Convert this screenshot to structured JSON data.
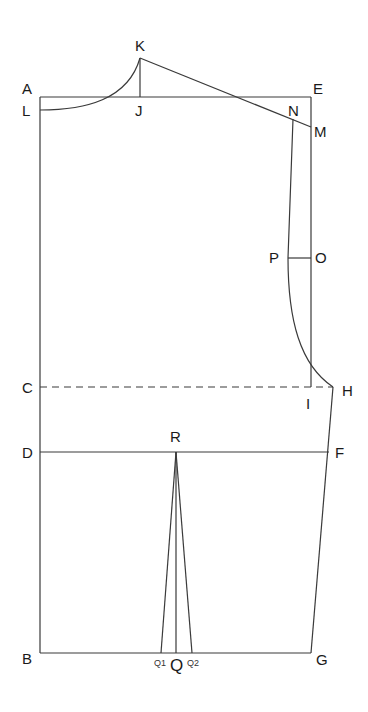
{
  "diagram": {
    "type": "bodice-pattern-draft",
    "line_color": "#3a3a3a",
    "label_color": "#1a1a1a",
    "points": {
      "A": {
        "label": "A",
        "x": 40,
        "y": 97
      },
      "B": {
        "label": "B",
        "x": 40,
        "y": 653
      },
      "C": {
        "label": "C",
        "x": 40,
        "y": 387
      },
      "D": {
        "label": "D",
        "x": 40,
        "y": 452
      },
      "E": {
        "label": "E",
        "x": 311,
        "y": 97
      },
      "F": {
        "label": "F",
        "x": 329,
        "y": 452
      },
      "G": {
        "label": "G",
        "x": 311,
        "y": 653
      },
      "H": {
        "label": "H",
        "x": 333,
        "y": 387
      },
      "I": {
        "label": "I",
        "x": 311,
        "y": 387
      },
      "J": {
        "label": "J",
        "x": 140,
        "y": 97
      },
      "K": {
        "label": "K",
        "x": 140,
        "y": 58
      },
      "L": {
        "label": "L",
        "x": 40,
        "y": 110
      },
      "M": {
        "label": "M",
        "x": 311,
        "y": 127
      },
      "N": {
        "label": "N",
        "x": 293,
        "y": 119
      },
      "O": {
        "label": "O",
        "x": 311,
        "y": 258
      },
      "P": {
        "label": "P",
        "x": 288,
        "y": 258
      },
      "Q": {
        "label": "Q",
        "x": 176,
        "y": 653
      },
      "Q1": {
        "label": "Q1",
        "x": 161,
        "y": 653
      },
      "Q2": {
        "label": "Q2",
        "x": 192,
        "y": 653
      },
      "R": {
        "label": "R",
        "x": 176,
        "y": 452
      }
    },
    "segments": [
      {
        "from": "A",
        "to": "E",
        "style": "solid"
      },
      {
        "from": "A",
        "to": "B",
        "style": "solid"
      },
      {
        "from": "E",
        "to": "I",
        "style": "solid"
      },
      {
        "from": "B",
        "to": "G",
        "style": "solid"
      },
      {
        "from": "C",
        "to": "H",
        "style": "dashed"
      },
      {
        "from": "D",
        "to": "F",
        "style": "solid"
      },
      {
        "from": "K",
        "to": "J",
        "style": "solid"
      },
      {
        "from": "K",
        "to": "M",
        "style": "solid"
      },
      {
        "from": "P",
        "to": "O",
        "style": "solid"
      },
      {
        "from": "H",
        "to": "G",
        "style": "solid"
      },
      {
        "from": "R",
        "to": "Q",
        "style": "solid"
      },
      {
        "from": "R",
        "to": "Q1",
        "style": "solid"
      },
      {
        "from": "R",
        "to": "Q2",
        "style": "solid"
      }
    ],
    "curves": [
      {
        "name": "neckline",
        "from": "L",
        "to": "K"
      },
      {
        "name": "armhole",
        "from": "N",
        "via": "P",
        "to": "H"
      }
    ]
  }
}
